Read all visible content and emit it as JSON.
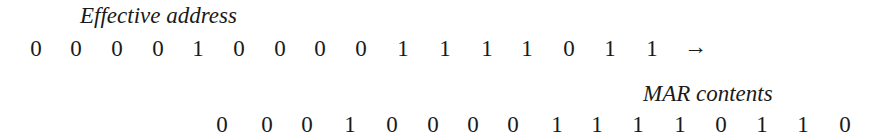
{
  "top": {
    "label": "Effective address",
    "bits": [
      "0",
      "0",
      "0",
      "0",
      "1",
      "0",
      "0",
      "0",
      "0",
      "1",
      "1",
      "1",
      "1",
      "0",
      "1",
      "1"
    ],
    "arrow": "→"
  },
  "bottom": {
    "label": "MAR contents",
    "bits": [
      "0",
      "0",
      "0",
      "1",
      "0",
      "0",
      "0",
      "0",
      "1",
      "1",
      "1",
      "1",
      "0",
      "1",
      "1",
      "0"
    ]
  }
}
